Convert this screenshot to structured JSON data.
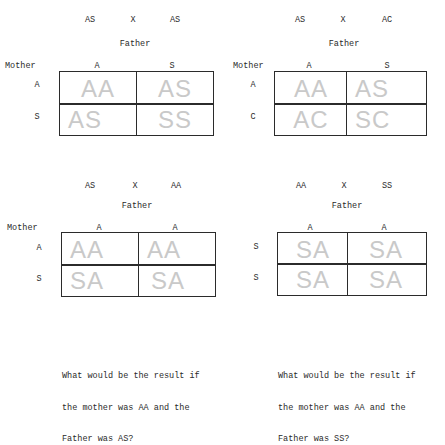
{
  "squares": [
    {
      "cross": {
        "mother": "AS",
        "x": "X",
        "father": "AS"
      },
      "father_label": "Father",
      "mother_label": "Mother",
      "columns": [
        "A",
        "S"
      ],
      "rows": [
        "A",
        "S"
      ],
      "cells": [
        [
          "AA",
          "AS"
        ],
        [
          "AS",
          "SS"
        ]
      ]
    },
    {
      "cross": {
        "mother": "AS",
        "x": "X",
        "father": "AC"
      },
      "father_label": "Father",
      "mother_label": "Mother",
      "columns": [
        "A",
        "S"
      ],
      "rows": [
        "A",
        "C"
      ],
      "cells": [
        [
          "AA",
          "AS"
        ],
        [
          "AC",
          "SC"
        ]
      ]
    },
    {
      "cross": {
        "mother": "AS",
        "x": "X",
        "father": "AA"
      },
      "father_label": "Father",
      "mother_label": "Mother",
      "columns": [
        "A",
        "A"
      ],
      "rows": [
        "A",
        "S"
      ],
      "cells": [
        [
          "AA",
          "AA"
        ],
        [
          "SA",
          "SA"
        ]
      ]
    },
    {
      "cross": {
        "mother": "AA",
        "x": "X",
        "father": "SS"
      },
      "father_label": "Father",
      "columns": [
        "A",
        "A"
      ],
      "rows": [
        "S",
        "S"
      ],
      "cells": [
        [
          "SA",
          "SA"
        ],
        [
          "SA",
          "SA"
        ]
      ]
    }
  ],
  "questions": [
    {
      "lines": [
        "What would be the result if",
        "the mother was AA and the",
        "Father was AS?"
      ]
    },
    {
      "lines": [
        "What would be the result if",
        "the mother was AA and the",
        "Father was SS?"
      ]
    }
  ]
}
